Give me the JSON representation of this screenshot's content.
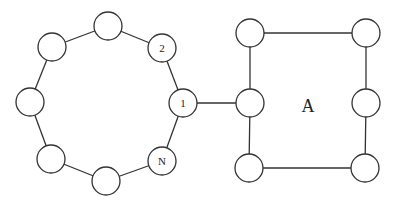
{
  "diagram": {
    "node_radius": 14,
    "stroke_color": "#333333",
    "ring": {
      "nodes": [
        {
          "id": "r1",
          "label": "1",
          "x": 183,
          "y": 103
        },
        {
          "id": "r2",
          "label": "2",
          "x": 162,
          "y": 48
        },
        {
          "id": "r3",
          "label": "",
          "x": 108,
          "y": 26
        },
        {
          "id": "r4",
          "label": "",
          "x": 52,
          "y": 47
        },
        {
          "id": "r5",
          "label": "",
          "x": 30,
          "y": 102
        },
        {
          "id": "r6",
          "label": "",
          "x": 51,
          "y": 159
        },
        {
          "id": "r7",
          "label": "",
          "x": 106,
          "y": 181
        },
        {
          "id": "rN",
          "label": "N",
          "x": 162,
          "y": 161
        }
      ]
    },
    "square": {
      "label": "A",
      "label_x": 308,
      "label_y": 106,
      "nodes": [
        {
          "id": "s_tl",
          "label": "",
          "x": 250,
          "y": 33
        },
        {
          "id": "s_tr",
          "label": "",
          "x": 366,
          "y": 33
        },
        {
          "id": "s_ml",
          "label": "",
          "x": 250,
          "y": 103
        },
        {
          "id": "s_mr",
          "label": "",
          "x": 366,
          "y": 103
        },
        {
          "id": "s_bl",
          "label": "",
          "x": 249,
          "y": 168
        },
        {
          "id": "s_br",
          "label": "",
          "x": 365,
          "y": 168
        }
      ]
    },
    "edges": [
      [
        "r1",
        "r2"
      ],
      [
        "r2",
        "r3"
      ],
      [
        "r3",
        "r4"
      ],
      [
        "r4",
        "r5"
      ],
      [
        "r5",
        "r6"
      ],
      [
        "r6",
        "r7"
      ],
      [
        "r7",
        "rN"
      ],
      [
        "rN",
        "r1"
      ],
      [
        "r1",
        "s_ml"
      ],
      [
        "s_tl",
        "s_tr"
      ],
      [
        "s_tl",
        "s_ml"
      ],
      [
        "s_ml",
        "s_bl"
      ],
      [
        "s_bl",
        "s_br"
      ],
      [
        "s_tr",
        "s_mr"
      ],
      [
        "s_mr",
        "s_br"
      ]
    ]
  }
}
